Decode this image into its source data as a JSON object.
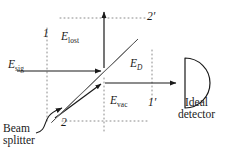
{
  "figure": {
    "type": "optics-diagram",
    "width": 231,
    "height": 154,
    "background": "#ffffff",
    "ink_color": "#1a1a1a",
    "beamsplitter_fill": "#d9d9d9",
    "dotted_color": "#8a8a8a"
  },
  "fields": {
    "signal": {
      "symbol": "E",
      "subscript": "sig",
      "label": "E_sig"
    },
    "lost": {
      "symbol": "E",
      "subscript": "lost",
      "label": "E_lost"
    },
    "vacuum": {
      "symbol": "E",
      "subscript": "vac",
      "label": "E_vac"
    },
    "detected": {
      "symbol": "E",
      "subscript": "D",
      "label": "E_D"
    }
  },
  "ports": {
    "input_one": "1",
    "input_two": "2",
    "output_one": "1′",
    "output_two": "2′"
  },
  "components": {
    "beam_splitter": {
      "label_line_1": "Beam",
      "label_line_2": "splitter"
    },
    "detector": {
      "label_line_1": "Ideal",
      "label_line_2": "detector"
    }
  }
}
